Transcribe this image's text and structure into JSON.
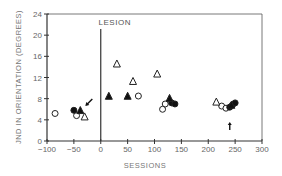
{
  "chart_data": {
    "type": "scatter",
    "title": "",
    "xlabel": "SESSIONS",
    "ylabel": "JND IN ORIENTATION (DEGREES)",
    "xlim": [
      -100,
      300
    ],
    "ylim": [
      0,
      24
    ],
    "xticks": [
      -100,
      -50,
      0,
      50,
      100,
      150,
      200,
      250,
      300
    ],
    "xtick_labels": [
      "−100",
      "−50",
      "0",
      "50",
      "100",
      "150",
      "200",
      "250",
      "300"
    ],
    "yticks": [
      0,
      4,
      8,
      12,
      16,
      20,
      24
    ],
    "ytick_labels": [
      "0",
      "4",
      "8",
      "12",
      "16",
      "20",
      "24"
    ],
    "grid": false,
    "legend": null,
    "annotations": [
      {
        "text": "LESION",
        "x": 0,
        "type": "vertical-line"
      },
      {
        "text": "arrow",
        "x": -25,
        "y": 7,
        "direction": "down-left"
      },
      {
        "text": "arrow",
        "x": 240,
        "y": 3.2,
        "direction": "up"
      }
    ],
    "series": [
      {
        "name": "open-circle",
        "marker": "circle",
        "filled": false,
        "points": [
          [
            -85,
            5.2
          ],
          [
            -45,
            4.8
          ],
          [
            70,
            8.5
          ],
          [
            115,
            6.0
          ],
          [
            120,
            7.0
          ],
          [
            225,
            6.6
          ],
          [
            233,
            6.2
          ]
        ]
      },
      {
        "name": "filled-circle",
        "marker": "circle",
        "filled": true,
        "points": [
          [
            -50,
            5.8
          ],
          [
            132,
            7.2
          ],
          [
            138,
            7.0
          ],
          [
            240,
            6.4
          ],
          [
            245,
            6.8
          ],
          [
            250,
            7.2
          ]
        ]
      },
      {
        "name": "open-triangle",
        "marker": "triangle",
        "filled": false,
        "points": [
          [
            -30,
            4.6
          ],
          [
            30,
            14.6
          ],
          [
            60,
            11.3
          ],
          [
            105,
            12.7
          ],
          [
            215,
            7.4
          ]
        ]
      },
      {
        "name": "filled-triangle",
        "marker": "triangle",
        "filled": true,
        "points": [
          [
            -38,
            5.8
          ],
          [
            15,
            8.5
          ],
          [
            50,
            8.5
          ],
          [
            128,
            8.1
          ],
          [
            243,
            6.8
          ]
        ]
      }
    ]
  }
}
